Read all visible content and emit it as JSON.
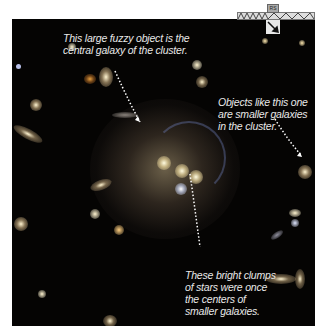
{
  "image": {
    "subject": "galaxy-cluster",
    "background_color": "#050403",
    "scale_bar_label": "RS"
  },
  "annotations": [
    {
      "id": "central-galaxy",
      "text_lines": [
        "This large fuzzy object is the",
        "central galaxy of the cluster."
      ]
    },
    {
      "id": "smaller-galaxies",
      "text_lines": [
        "Objects like this one",
        "are smaller galaxies",
        "in the cluster."
      ]
    },
    {
      "id": "bright-clumps",
      "text_lines": [
        "These bright clumps",
        "of stars were once",
        "the centers of",
        "smaller galaxies."
      ]
    }
  ],
  "colors": {
    "caption_text": "#e8e8e8",
    "pointer_dots": "#ffffff",
    "halo": "#b8a47a"
  }
}
